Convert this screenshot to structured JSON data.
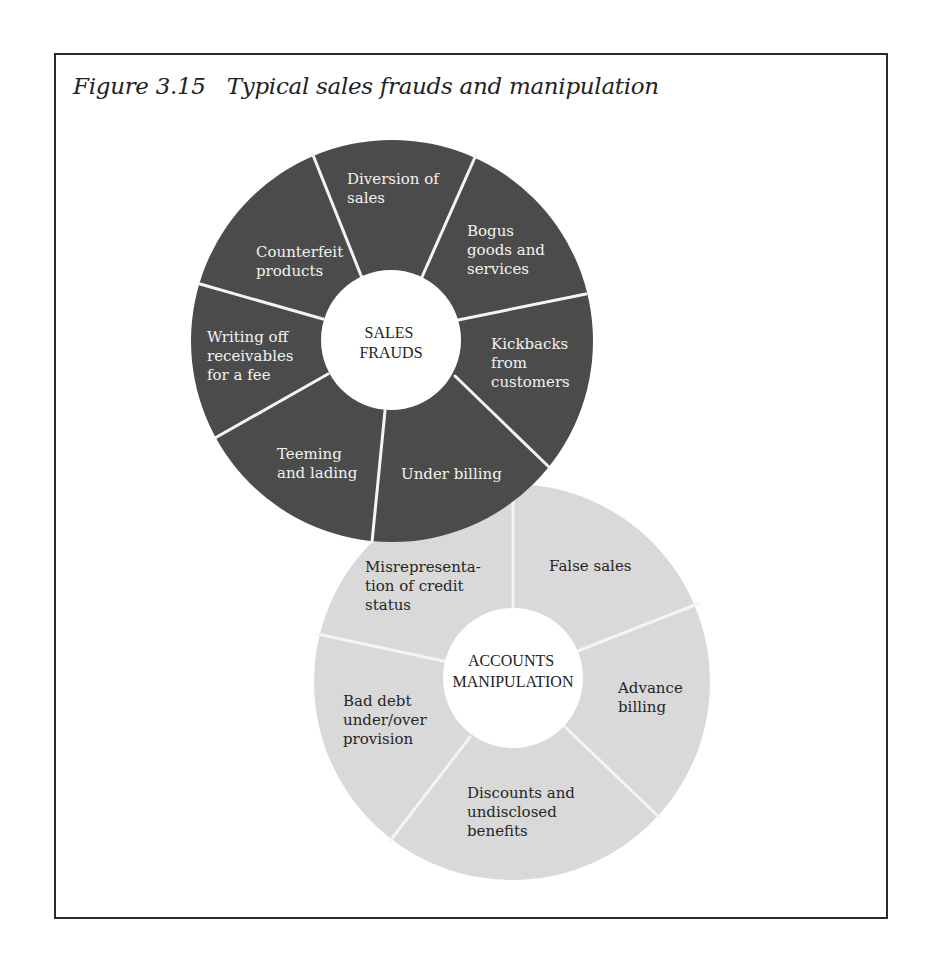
{
  "figure": {
    "title": "Figure 3.15   Typical sales frauds and manipulation"
  },
  "colors": {
    "dark_ring": "#4b4b4b",
    "light_ring": "#d9d9d9",
    "divider": "#f4f4f4",
    "hub": "#ffffff",
    "frame_border": "#2a2a2a"
  },
  "sales_frauds": {
    "hub_label": [
      "SALES",
      "FRAUDS"
    ],
    "segments": [
      {
        "label": [
          "Diversion of",
          "sales"
        ]
      },
      {
        "label": [
          "Bogus",
          "goods and",
          "services"
        ]
      },
      {
        "label": [
          "Kickbacks",
          "from",
          "customers"
        ]
      },
      {
        "label": [
          "Under billing"
        ]
      },
      {
        "label": [
          "Teeming",
          "and lading"
        ]
      },
      {
        "label": [
          "Writing off",
          "receivables",
          "for a fee"
        ]
      },
      {
        "label": [
          "Counterfeit",
          "products"
        ]
      }
    ]
  },
  "accounts_manipulation": {
    "hub_label": [
      "ACCOUNTS",
      "MANIPULATION"
    ],
    "segments": [
      {
        "label": [
          "False sales"
        ]
      },
      {
        "label": [
          "Advance",
          "billing"
        ]
      },
      {
        "label": [
          "Discounts and",
          "undisclosed",
          "benefits"
        ]
      },
      {
        "label": [
          "Bad debt",
          "under/over",
          "provision"
        ]
      },
      {
        "label": [
          "Misrepresenta-",
          "tion of credit",
          "status"
        ]
      }
    ]
  }
}
